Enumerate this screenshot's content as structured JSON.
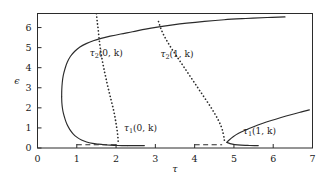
{
  "chart_data": {
    "type": "line",
    "title": "",
    "xlabel": "τ",
    "ylabel": "ϵ",
    "xlim": [
      0,
      7
    ],
    "ylim": [
      0,
      6.7
    ],
    "grid": false,
    "legend": "none",
    "xticks": [
      "0",
      "1",
      "2",
      "3",
      "4",
      "5",
      "6",
      "7"
    ],
    "xtick_values": [
      0,
      1,
      2,
      3,
      4,
      5,
      6,
      7
    ],
    "yticks": [
      "0",
      "1",
      "2",
      "3",
      "4",
      "5",
      "6"
    ],
    "ytick_values": [
      0,
      1,
      2,
      3,
      4,
      5,
      6
    ],
    "annotations": [
      {
        "name": "tau2-0k-label",
        "text_base": "τ",
        "text_sub": "2",
        "text_arg": "(0, k)",
        "x": 1.75,
        "y": 4.6
      },
      {
        "name": "tau2-1k-label",
        "text_base": "τ",
        "text_sub": "2",
        "text_arg": "(1, k)",
        "x": 3.55,
        "y": 4.55
      },
      {
        "name": "tau1-0k-label",
        "text_base": "τ",
        "text_sub": "1",
        "text_arg": "(0, k)",
        "x": 2.62,
        "y": 0.85
      },
      {
        "name": "tau1-1k-label",
        "text_base": "τ",
        "text_sub": "1",
        "text_arg": "(1, k)",
        "x": 5.65,
        "y": 0.72
      }
    ],
    "series": [
      {
        "name": "tau1(0,k) lower fold branch",
        "style": "solid",
        "points": [
          [
            2.3,
            0.12
          ],
          [
            2.15,
            0.12
          ],
          [
            2.0,
            0.13
          ],
          [
            1.85,
            0.14
          ],
          [
            1.7,
            0.16
          ],
          [
            1.55,
            0.19
          ],
          [
            1.4,
            0.23
          ],
          [
            1.25,
            0.3
          ],
          [
            1.12,
            0.4
          ],
          [
            1.0,
            0.54
          ],
          [
            0.9,
            0.72
          ],
          [
            0.82,
            0.93
          ],
          [
            0.75,
            1.18
          ],
          [
            0.7,
            1.45
          ],
          [
            0.66,
            1.72
          ],
          [
            0.635,
            1.98
          ],
          [
            0.62,
            2.25
          ],
          [
            0.615,
            2.55
          ]
        ]
      },
      {
        "name": "tau1(0,k) upper fold branch",
        "style": "solid",
        "points": [
          [
            0.615,
            2.55
          ],
          [
            0.618,
            2.9
          ],
          [
            0.63,
            3.25
          ],
          [
            0.655,
            3.6
          ],
          [
            0.7,
            3.95
          ],
          [
            0.76,
            4.28
          ],
          [
            0.84,
            4.57
          ],
          [
            0.95,
            4.82
          ],
          [
            1.08,
            5.03
          ],
          [
            1.24,
            5.2
          ],
          [
            1.42,
            5.34
          ],
          [
            1.62,
            5.46
          ],
          [
            1.85,
            5.57
          ],
          [
            2.12,
            5.68
          ],
          [
            2.42,
            5.79
          ],
          [
            2.75,
            5.92
          ],
          [
            3.05,
            6.02
          ],
          [
            3.4,
            6.12
          ],
          [
            3.8,
            6.22
          ],
          [
            4.25,
            6.31
          ],
          [
            4.75,
            6.39
          ],
          [
            5.3,
            6.45
          ],
          [
            5.85,
            6.5
          ],
          [
            6.3,
            6.53
          ]
        ]
      },
      {
        "name": "tau1(0,k) flat solid tail",
        "style": "solid",
        "points": [
          [
            2.3,
            0.12
          ],
          [
            2.45,
            0.12
          ],
          [
            2.6,
            0.12
          ],
          [
            2.72,
            0.12
          ]
        ]
      },
      {
        "name": "tau1(0,k) dashed base segment",
        "style": "dashed",
        "points": [
          [
            1.0,
            0.16
          ],
          [
            1.25,
            0.16
          ],
          [
            1.5,
            0.16
          ],
          [
            1.75,
            0.16
          ],
          [
            2.0,
            0.16
          ],
          [
            2.08,
            0.16
          ]
        ]
      },
      {
        "name": "tau1(1,k) lower fold branch",
        "style": "solid",
        "points": [
          [
            4.82,
            0.28
          ],
          [
            4.9,
            0.22
          ],
          [
            5.02,
            0.17
          ],
          [
            5.18,
            0.14
          ],
          [
            5.35,
            0.13
          ],
          [
            5.52,
            0.12
          ],
          [
            5.62,
            0.12
          ]
        ]
      },
      {
        "name": "tau1(1,k) upper fold branch",
        "style": "solid",
        "points": [
          [
            4.82,
            0.28
          ],
          [
            4.88,
            0.4
          ],
          [
            4.98,
            0.56
          ],
          [
            5.12,
            0.73
          ],
          [
            5.3,
            0.9
          ],
          [
            5.5,
            1.06
          ],
          [
            5.72,
            1.22
          ],
          [
            5.95,
            1.37
          ],
          [
            6.2,
            1.52
          ],
          [
            6.45,
            1.66
          ],
          [
            6.7,
            1.79
          ],
          [
            6.92,
            1.9
          ]
        ]
      },
      {
        "name": "tau1(1,k) dashed base segment",
        "style": "dashed",
        "points": [
          [
            4.0,
            0.16
          ],
          [
            4.2,
            0.16
          ],
          [
            4.4,
            0.16
          ],
          [
            4.6,
            0.16
          ],
          [
            4.7,
            0.16
          ]
        ]
      },
      {
        "name": "tau2(0,k)",
        "style": "dotted",
        "points": [
          [
            1.5,
            6.7
          ],
          [
            1.52,
            6.3
          ],
          [
            1.545,
            5.9
          ],
          [
            1.565,
            5.5
          ],
          [
            1.59,
            5.1
          ],
          [
            1.62,
            4.7
          ],
          [
            1.655,
            4.3
          ],
          [
            1.695,
            3.9
          ],
          [
            1.74,
            3.5
          ],
          [
            1.785,
            3.1
          ],
          [
            1.835,
            2.7
          ],
          [
            1.885,
            2.3
          ],
          [
            1.935,
            1.9
          ],
          [
            1.975,
            1.5
          ],
          [
            2.01,
            1.1
          ],
          [
            2.035,
            0.75
          ],
          [
            2.05,
            0.45
          ],
          [
            2.055,
            0.22
          ]
        ]
      },
      {
        "name": "tau2(1,k)",
        "style": "dotted",
        "points": [
          [
            3.08,
            6.3
          ],
          [
            3.14,
            5.95
          ],
          [
            3.22,
            5.6
          ],
          [
            3.32,
            5.25
          ],
          [
            3.43,
            4.9
          ],
          [
            3.55,
            4.55
          ],
          [
            3.67,
            4.2
          ],
          [
            3.79,
            3.85
          ],
          [
            3.91,
            3.5
          ],
          [
            4.03,
            3.15
          ],
          [
            4.15,
            2.8
          ],
          [
            4.27,
            2.45
          ],
          [
            4.39,
            2.1
          ],
          [
            4.5,
            1.75
          ],
          [
            4.6,
            1.4
          ],
          [
            4.68,
            1.05
          ],
          [
            4.73,
            0.7
          ],
          [
            4.755,
            0.42
          ],
          [
            4.76,
            0.25
          ]
        ]
      }
    ]
  },
  "colors": {
    "ink": "#2b2b2b",
    "background": "#ffffff"
  }
}
